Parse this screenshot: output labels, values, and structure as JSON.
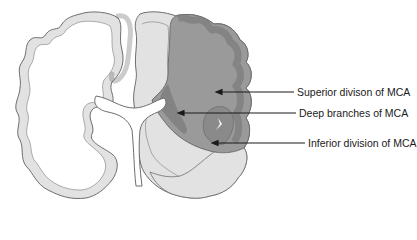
{
  "figure": {
    "colors": {
      "cortex_normal": "#e2e2e2",
      "outline": "#6e6e6e",
      "white_matter": "#ffffff",
      "mca_territory": "#9a9a9a",
      "mca_cortex": "#7c7c7c",
      "deep_branches": "#838383",
      "inferior_division": "#8a8a8a",
      "arrow": "#1a1a1a"
    },
    "labels": [
      {
        "id": "superior",
        "text": "Superior divison of MCA"
      },
      {
        "id": "deep",
        "text": "Deep branches of MCA"
      },
      {
        "id": "inferior",
        "text": "Inferior division of MCA"
      }
    ]
  }
}
